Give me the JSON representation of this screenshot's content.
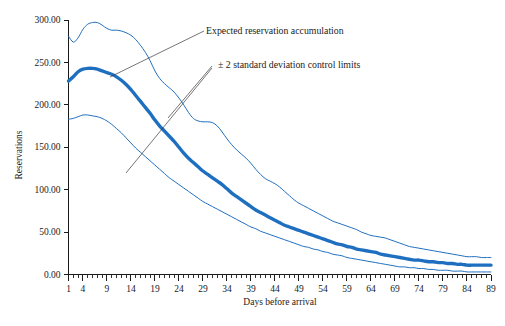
{
  "chart_data": {
    "type": "line",
    "title": "",
    "xlabel": "Days before arrival",
    "ylabel": "Reservations",
    "xlim": [
      1,
      89
    ],
    "ylim": [
      0,
      300
    ],
    "grid": false,
    "legend_position": "none",
    "accent_color": "#1f6fc0",
    "x_tick_labels": [
      "1",
      "4",
      "9",
      "14",
      "19",
      "24",
      "29",
      "34",
      "39",
      "44",
      "49",
      "54",
      "59",
      "64",
      "69",
      "74",
      "79",
      "84",
      "89"
    ],
    "x_ticks": [
      1,
      4,
      9,
      14,
      19,
      24,
      29,
      34,
      39,
      44,
      49,
      54,
      59,
      64,
      69,
      74,
      79,
      84,
      89
    ],
    "y_tick_labels": [
      "0.00",
      "50.00",
      "100.00",
      "150.00",
      "200.00",
      "250.00",
      "300.00"
    ],
    "y_ticks": [
      0,
      50,
      100,
      150,
      200,
      250,
      300
    ],
    "x": [
      1,
      2,
      3,
      4,
      5,
      6,
      7,
      8,
      9,
      10,
      11,
      12,
      13,
      14,
      15,
      16,
      17,
      18,
      19,
      20,
      21,
      22,
      23,
      24,
      25,
      26,
      27,
      28,
      29,
      30,
      31,
      32,
      33,
      34,
      35,
      36,
      37,
      38,
      39,
      40,
      41,
      42,
      43,
      44,
      45,
      46,
      47,
      48,
      49,
      50,
      51,
      52,
      53,
      54,
      55,
      56,
      57,
      58,
      59,
      60,
      61,
      62,
      63,
      64,
      65,
      66,
      67,
      68,
      69,
      70,
      71,
      72,
      73,
      74,
      75,
      76,
      77,
      78,
      79,
      80,
      81,
      82,
      83,
      84,
      85,
      86,
      87,
      88,
      89
    ],
    "series": [
      {
        "name": "Upper 2 standard deviation control limit",
        "style": "thin",
        "values": [
          281,
          274,
          279,
          289,
          295,
          297,
          297,
          294,
          290,
          288,
          288,
          287,
          285,
          282,
          277,
          270,
          262,
          252,
          240,
          231,
          225,
          220,
          215,
          208,
          200,
          191,
          184,
          181,
          180,
          180,
          179,
          175,
          168,
          160,
          153,
          147,
          142,
          137,
          131,
          124,
          118,
          113,
          110,
          107,
          103,
          98,
          93,
          88,
          84,
          81,
          78,
          75,
          72,
          69,
          66,
          63,
          61,
          59,
          57,
          55,
          53,
          50,
          48,
          46,
          45,
          44,
          43,
          41,
          39,
          37,
          35,
          33,
          32,
          31,
          30,
          29,
          28,
          27,
          26,
          25,
          24,
          23,
          22,
          21,
          21,
          21,
          20,
          20,
          20
        ]
      },
      {
        "name": "Expected reservation accumulation",
        "style": "thick",
        "values": [
          228,
          233,
          239,
          242,
          243,
          243,
          242,
          240,
          238,
          236,
          233,
          229,
          224,
          218,
          211,
          204,
          197,
          190,
          182,
          175,
          169,
          163,
          157,
          150,
          143,
          137,
          132,
          127,
          122,
          118,
          114,
          110,
          106,
          101,
          96,
          92,
          88,
          84,
          80,
          76,
          73,
          70,
          67,
          64,
          61,
          58,
          56,
          54,
          52,
          50,
          48,
          46,
          44,
          42,
          40,
          38,
          36,
          35,
          33,
          32,
          30,
          29,
          28,
          27,
          26,
          24,
          23,
          22,
          21,
          20,
          19,
          18,
          17,
          17,
          16,
          15,
          15,
          14,
          14,
          13,
          13,
          12,
          12,
          11,
          11,
          11,
          11,
          11,
          11
        ]
      },
      {
        "name": "Lower 2 standard deviation control limit",
        "style": "thin",
        "values": [
          183,
          184,
          186,
          188,
          188,
          187,
          186,
          184,
          181,
          177,
          172,
          167,
          161,
          155,
          149,
          144,
          139,
          134,
          129,
          124,
          119,
          114,
          110,
          106,
          102,
          98,
          94,
          90,
          86,
          83,
          80,
          77,
          74,
          71,
          68,
          65,
          62,
          59,
          56,
          54,
          51,
          49,
          47,
          45,
          43,
          41,
          39,
          37,
          35,
          33,
          32,
          30,
          29,
          27,
          26,
          24,
          23,
          22,
          20,
          19,
          18,
          17,
          16,
          15,
          14,
          13,
          12,
          11,
          10,
          9,
          9,
          8,
          8,
          7,
          7,
          6,
          6,
          5,
          5,
          5,
          4,
          4,
          4,
          3,
          3,
          3,
          3,
          3,
          3
        ]
      }
    ],
    "annotations": [
      {
        "id": "expected-annotation",
        "text": "Expected reservation accumulation",
        "text_x": 206,
        "text_y": 34,
        "leader": [
          [
            204,
            31
          ],
          [
            110,
            77
          ]
        ]
      },
      {
        "id": "control-limits-annotation",
        "text": "± 2 standard deviation control limits",
        "text_x": 218,
        "text_y": 68,
        "leader_a": [
          [
            212,
            66
          ],
          [
            168,
            118
          ]
        ],
        "leader_b": [
          [
            212,
            68
          ],
          [
            126,
            173
          ]
        ]
      }
    ]
  }
}
